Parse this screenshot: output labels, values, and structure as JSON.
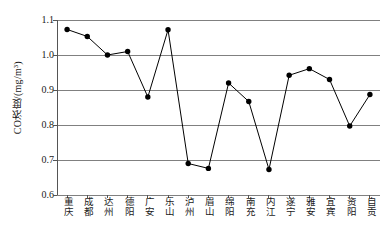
{
  "chart_data": {
    "type": "line",
    "title": "",
    "xlabel": "",
    "ylabel": "CO浓度/(mg/m³)",
    "ylim": [
      0.6,
      1.1
    ],
    "yticks": [
      "1.1",
      "1.0",
      "0.9",
      "0.8",
      "0.7",
      "0.6"
    ],
    "ytick_values": [
      1.1,
      1.0,
      0.9,
      0.8,
      0.7,
      0.6
    ],
    "grid": true,
    "grid_axis": "y",
    "legend": "none",
    "marker": "filled-circle",
    "line_color": "#000000",
    "marker_color": "#000000",
    "grid_color": "#808080",
    "categories": [
      "重庆",
      "成都",
      "达州",
      "德阳",
      "广安",
      "乐山",
      "泸州",
      "眉山",
      "绵阳",
      "南充",
      "内江",
      "遂宁",
      "雅安",
      "宜宾",
      "资阳",
      "自贡"
    ],
    "values": [
      1.073,
      1.053,
      1.0,
      1.01,
      0.88,
      1.072,
      0.69,
      0.676,
      0.92,
      0.867,
      0.673,
      0.942,
      0.961,
      0.93,
      0.797,
      0.887
    ]
  }
}
